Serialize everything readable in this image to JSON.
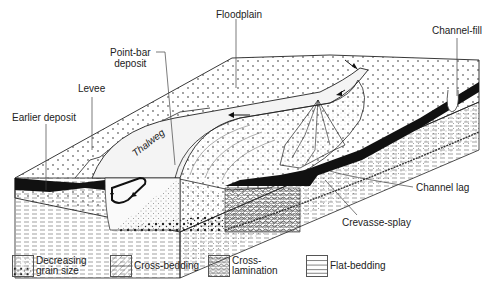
{
  "labels": {
    "floodplain": "Floodplain",
    "channel_fill": "Channel-fill",
    "point_bar": "Point-bar\ndeposit",
    "point_bar_line1": "Point-bar",
    "point_bar_line2": "deposit",
    "levee": "Levee",
    "earlier_deposit": "Earlier deposit",
    "thalweg": "Thalweg",
    "channel_lag": "Channel lag",
    "crevasse_splay": "Crevasse-splay"
  },
  "legend": {
    "items": [
      {
        "label": "Decreasing\ngrain size",
        "pattern": "decreasing-grain-size"
      },
      {
        "label": "Cross-bedding",
        "pattern": "cross-bedding"
      },
      {
        "label": "Cross-\nlamination",
        "pattern": "cross-lamination"
      },
      {
        "label": "Flat-bedding",
        "pattern": "flat-bedding"
      }
    ]
  },
  "colors": {
    "ink": "#1a1a1a",
    "background": "#ffffff",
    "stipple": "#8a8a8a"
  }
}
